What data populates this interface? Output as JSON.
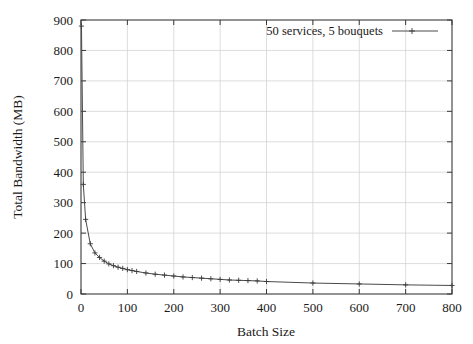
{
  "chart_data": {
    "type": "line",
    "title": "",
    "xlabel": "Batch Size",
    "ylabel": "Total Bandwidth (MB)",
    "xlim": [
      0,
      800
    ],
    "ylim": [
      0,
      900
    ],
    "xticks": [
      0,
      100,
      200,
      300,
      400,
      500,
      600,
      700,
      800
    ],
    "yticks": [
      0,
      100,
      200,
      300,
      400,
      500,
      600,
      700,
      800,
      900
    ],
    "xtick_labels": [
      "0",
      "100",
      "200",
      "300",
      "400",
      "500",
      "600",
      "700",
      "800"
    ],
    "ytick_labels": [
      "0",
      "100",
      "200",
      "300",
      "400",
      "500",
      "600",
      "700",
      "800",
      "900"
    ],
    "grid": true,
    "grid_axis": "both",
    "legend_position": "top-center-right",
    "marker": "plus",
    "line_color": "#4a4a4a",
    "series": [
      {
        "name": "50 services, 5 bouquets",
        "x": [
          1,
          5,
          10,
          20,
          30,
          40,
          50,
          60,
          70,
          80,
          90,
          100,
          110,
          120,
          140,
          160,
          180,
          200,
          220,
          240,
          260,
          280,
          300,
          320,
          340,
          360,
          380,
          400,
          500,
          600,
          700,
          800
        ],
        "y": [
          880,
          360,
          245,
          165,
          135,
          120,
          108,
          99,
          93,
          88,
          84,
          80,
          77,
          74,
          69,
          65,
          62,
          59,
          56,
          54,
          52,
          50,
          48,
          46,
          45,
          44,
          43,
          41,
          36,
          33,
          30,
          28
        ]
      }
    ]
  },
  "legend": {
    "entries": [
      {
        "label": "50 services, 5 bouquets",
        "marker": "plus-marker",
        "color": "#4a4a4a"
      }
    ]
  },
  "axes": {
    "x_title": "Batch Size",
    "y_title": "Total Bandwidth (MB)"
  }
}
